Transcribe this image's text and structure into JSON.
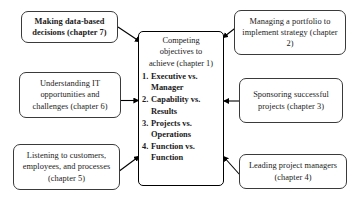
{
  "diagram": {
    "center": {
      "heading_lines": [
        "Competing",
        "objectives to",
        "achieve (chapter 1)"
      ],
      "items": [
        {
          "num": "1.",
          "label": "Executive vs. Manager"
        },
        {
          "num": "2.",
          "label": "Capability vs. Results"
        },
        {
          "num": "3.",
          "label": "Projects vs. Operations"
        },
        {
          "num": "4.",
          "label": "Function vs. Function"
        }
      ]
    },
    "nodes": [
      {
        "id": "top-left",
        "text": "Making data-based decisions (chapter 7)",
        "bold": true
      },
      {
        "id": "top-right",
        "text": "Managing a portfolio to implement strategy (chapter 2)",
        "bold": false
      },
      {
        "id": "middle-left",
        "text": "Understanding IT opportunities and challenges (chapter 6)",
        "bold": false
      },
      {
        "id": "middle-right",
        "text": "Sponsoring successful projects (chapter 3)",
        "bold": false
      },
      {
        "id": "bottom-left",
        "text": "Listening to customers, employees, and processes (chapter 5)",
        "bold": false
      },
      {
        "id": "bottom-right",
        "text": "Leading project managers (chapter 4)",
        "bold": false
      }
    ],
    "colors": {
      "background": "#ffffff",
      "box_border": "#3a3a3a",
      "center_border": "#000000",
      "arrow": "#000000",
      "text": "#1a1a1a"
    }
  }
}
